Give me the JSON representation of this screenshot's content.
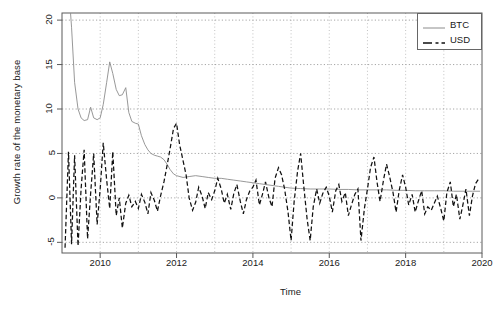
{
  "chart_data": {
    "type": "line",
    "title": "",
    "xlabel": "Time",
    "ylabel": "Growth rate of the monetary base",
    "xlim": [
      2009.0,
      2020.0
    ],
    "ylim": [
      -6.2,
      20.8
    ],
    "xticks": [
      2010,
      2012,
      2014,
      2016,
      2018,
      2020
    ],
    "xtick_labels": [
      "2010",
      "2012",
      "2014",
      "2016",
      "2018",
      "2020"
    ],
    "yticks": [
      -5,
      0,
      5,
      10,
      15,
      20
    ],
    "ytick_labels": [
      "-5",
      "0",
      "5",
      "10",
      "15",
      "20"
    ],
    "grid": true,
    "grid_style": "dotted",
    "legend_position": "top-right",
    "series": [
      {
        "name": "BTC",
        "style": "solid",
        "color": "#8c8c8c",
        "x": [
          2009.1,
          2009.17,
          2009.25,
          2009.33,
          2009.42,
          2009.5,
          2009.58,
          2009.67,
          2009.75,
          2009.83,
          2009.92,
          2010.0,
          2010.08,
          2010.17,
          2010.25,
          2010.33,
          2010.42,
          2010.5,
          2010.58,
          2010.67,
          2010.75,
          2010.83,
          2010.92,
          2011.0,
          2011.08,
          2011.17,
          2011.25,
          2011.33,
          2011.42,
          2011.5,
          2011.58,
          2011.67,
          2011.75,
          2011.83,
          2011.92,
          2012.0,
          2012.17,
          2012.33,
          2012.5,
          2012.67,
          2012.83,
          2013.0,
          2013.17,
          2013.33,
          2013.5,
          2013.67,
          2013.83,
          2014.0,
          2014.17,
          2014.33,
          2014.5,
          2014.67,
          2014.83,
          2015.0,
          2015.25,
          2015.5,
          2015.75,
          2016.0,
          2016.25,
          2016.5,
          2016.75,
          2017.0,
          2017.25,
          2017.5,
          2017.75,
          2018.0,
          2018.25,
          2018.5,
          2018.75,
          2019.0,
          2019.25,
          2019.5,
          2019.75,
          2019.95
        ],
        "y": [
          30.0,
          24.0,
          19.2,
          13.0,
          10.0,
          9.0,
          8.7,
          8.8,
          10.2,
          9.0,
          8.8,
          9.0,
          10.5,
          13.0,
          15.3,
          14.0,
          12.2,
          11.5,
          11.6,
          12.4,
          9.6,
          8.6,
          8.4,
          8.3,
          7.0,
          6.0,
          5.4,
          5.0,
          4.8,
          4.7,
          4.6,
          4.3,
          3.8,
          3.2,
          2.7,
          2.5,
          2.3,
          2.4,
          2.5,
          2.4,
          2.3,
          2.2,
          2.2,
          2.1,
          2.0,
          1.9,
          1.8,
          1.7,
          1.6,
          1.5,
          1.4,
          1.3,
          1.2,
          1.1,
          1.05,
          1.0,
          1.0,
          1.0,
          0.95,
          0.95,
          0.9,
          0.9,
          0.9,
          0.9,
          0.85,
          0.85,
          0.8,
          0.8,
          0.8,
          0.8,
          0.75,
          0.75,
          0.75,
          0.75
        ]
      },
      {
        "name": "USD",
        "style": "dashed",
        "color": "#111111",
        "x": [
          2009.08,
          2009.17,
          2009.25,
          2009.33,
          2009.42,
          2009.5,
          2009.58,
          2009.67,
          2009.75,
          2009.83,
          2009.92,
          2010.0,
          2010.08,
          2010.17,
          2010.25,
          2010.33,
          2010.42,
          2010.5,
          2010.58,
          2010.67,
          2010.75,
          2010.83,
          2010.92,
          2011.0,
          2011.08,
          2011.17,
          2011.25,
          2011.33,
          2011.42,
          2011.5,
          2011.58,
          2011.67,
          2011.75,
          2011.83,
          2011.92,
          2012.0,
          2012.08,
          2012.17,
          2012.25,
          2012.33,
          2012.42,
          2012.5,
          2012.58,
          2012.67,
          2012.75,
          2012.83,
          2012.92,
          2013.0,
          2013.08,
          2013.17,
          2013.25,
          2013.33,
          2013.42,
          2013.5,
          2013.58,
          2013.67,
          2013.75,
          2013.83,
          2013.92,
          2014.0,
          2014.08,
          2014.17,
          2014.25,
          2014.33,
          2014.42,
          2014.5,
          2014.58,
          2014.67,
          2014.75,
          2014.83,
          2014.92,
          2015.0,
          2015.08,
          2015.17,
          2015.25,
          2015.33,
          2015.42,
          2015.5,
          2015.58,
          2015.67,
          2015.75,
          2015.83,
          2015.92,
          2016.0,
          2016.08,
          2016.17,
          2016.25,
          2016.33,
          2016.42,
          2016.5,
          2016.58,
          2016.67,
          2016.75,
          2016.83,
          2016.92,
          2017.0,
          2017.08,
          2017.17,
          2017.25,
          2017.33,
          2017.42,
          2017.5,
          2017.58,
          2017.67,
          2017.75,
          2017.83,
          2017.92,
          2018.0,
          2018.08,
          2018.17,
          2018.25,
          2018.33,
          2018.42,
          2018.5,
          2018.58,
          2018.67,
          2018.75,
          2018.83,
          2018.92,
          2019.0,
          2019.08,
          2019.17,
          2019.25,
          2019.33,
          2019.42,
          2019.5,
          2019.58,
          2019.67,
          2019.75,
          2019.83,
          2019.92
        ],
        "y": [
          -5.6,
          5.2,
          -5.2,
          4.8,
          -5.4,
          1.0,
          5.4,
          -4.6,
          0.5,
          5.0,
          -3.0,
          1.0,
          6.2,
          2.0,
          -1.2,
          5.2,
          -2.0,
          0.0,
          -3.4,
          -0.6,
          0.3,
          -1.0,
          -0.4,
          -1.2,
          0.4,
          -0.5,
          -1.8,
          0.6,
          -0.3,
          -1.5,
          0.2,
          1.8,
          3.6,
          5.5,
          7.8,
          8.4,
          6.0,
          4.2,
          2.6,
          0.0,
          -1.4,
          -0.5,
          1.2,
          0.2,
          -1.2,
          0.6,
          -0.2,
          0.8,
          2.2,
          1.0,
          -0.6,
          0.4,
          -1.3,
          0.5,
          1.5,
          -0.4,
          -1.8,
          -0.2,
          0.8,
          1.2,
          2.0,
          -0.8,
          0.4,
          1.8,
          0.0,
          -1.0,
          2.2,
          3.4,
          2.6,
          1.0,
          -1.6,
          -4.8,
          -0.4,
          3.0,
          5.0,
          1.4,
          -2.4,
          -4.8,
          -1.0,
          1.0,
          -0.6,
          0.5,
          1.2,
          0.2,
          -1.6,
          0.8,
          1.5,
          -0.4,
          0.6,
          -2.0,
          -0.8,
          0.4,
          1.0,
          -4.8,
          -1.2,
          1.0,
          3.4,
          4.6,
          1.8,
          -0.4,
          2.0,
          3.8,
          2.4,
          0.6,
          -1.6,
          0.8,
          2.6,
          1.2,
          -0.8,
          0.4,
          -1.6,
          -0.4,
          0.8,
          -1.8,
          -1.0,
          -1.4,
          -0.6,
          0.2,
          -1.2,
          -2.6,
          0.6,
          1.8,
          -1.0,
          0.4,
          -2.4,
          -0.8,
          1.0,
          -2.0,
          0.2,
          1.6,
          2.2
        ]
      }
    ]
  },
  "legend": {
    "items": [
      {
        "label": "BTC",
        "style": "solid"
      },
      {
        "label": "USD",
        "style": "dashed"
      }
    ]
  }
}
